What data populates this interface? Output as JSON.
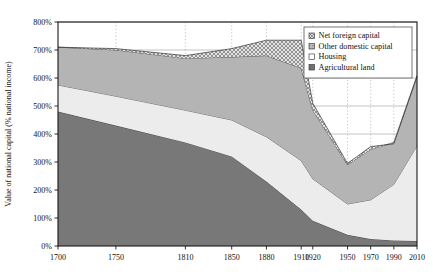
{
  "chart_data": {
    "type": "area",
    "title": "",
    "xlabel": "",
    "ylabel": "Value of national capital (% national income)",
    "x": [
      1700,
      1750,
      1810,
      1850,
      1880,
      1910,
      1920,
      1950,
      1970,
      1990,
      2010
    ],
    "xtick_labels": [
      "1700",
      "1750",
      "1810",
      "1850",
      "1880",
      "1910",
      "1920",
      "1950",
      "1970",
      "1990",
      "2010"
    ],
    "ytick_labels": [
      "0%",
      "100%",
      "200%",
      "300%",
      "400%",
      "500%",
      "600%",
      "700%",
      "800%"
    ],
    "ylim": [
      0,
      800
    ],
    "ytick_values": [
      0,
      100,
      200,
      300,
      400,
      500,
      600,
      700,
      800
    ],
    "grid": "vertical-dotted-and-horizontal-solid",
    "legend_position": "top-right",
    "stacked": true,
    "series": [
      {
        "name": "Agricultural land",
        "key": "agricultural_land",
        "values": [
          480,
          430,
          370,
          320,
          230,
          130,
          90,
          40,
          25,
          20,
          18
        ]
      },
      {
        "name": "Housing",
        "key": "housing",
        "values": [
          95,
          105,
          115,
          130,
          160,
          175,
          150,
          110,
          140,
          200,
          340
        ]
      },
      {
        "name": "Other domestic capital",
        "key": "other_domestic_capital",
        "values": [
          135,
          165,
          185,
          225,
          290,
          330,
          245,
          140,
          180,
          150,
          250
        ]
      },
      {
        "name": "Net foreign capital",
        "key": "net_foreign_capital",
        "values": [
          0,
          5,
          10,
          30,
          55,
          100,
          25,
          5,
          10,
          -5,
          -3
        ]
      }
    ],
    "totals": [
      710,
      705,
      680,
      705,
      735,
      735,
      510,
      295,
      355,
      365,
      605
    ],
    "colors": {
      "agricultural_land": "#787878",
      "housing": "#ececec",
      "other_domestic_capital": "#b4b4b4",
      "net_foreign_capital": "#c9c9c9",
      "axis": "#1a1a1a",
      "gridline": "#9a9a9a",
      "legend_border": "#555555",
      "background": "#ffffff"
    }
  },
  "legend": {
    "items": [
      {
        "label": "Net foreign capital",
        "swatch": "crosshatch"
      },
      {
        "label": "Other domestic capital",
        "swatch": "mid-gray"
      },
      {
        "label": "Housing",
        "swatch": "white"
      },
      {
        "label": "Agricultural land",
        "swatch": "dark-gray"
      }
    ]
  }
}
